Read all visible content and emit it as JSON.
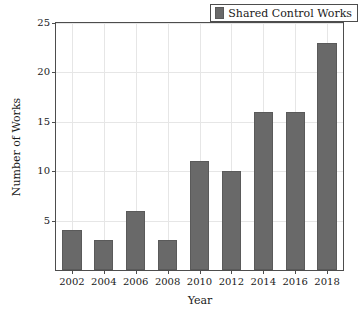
{
  "chart_data": {
    "type": "bar",
    "title": "",
    "subtitle": "",
    "xlabel": "Year",
    "ylabel": "Number of Works",
    "categories": [
      "2002",
      "2004",
      "2006",
      "2008",
      "2010",
      "2012",
      "2014",
      "2016",
      "2018"
    ],
    "values": [
      4,
      3,
      6,
      3,
      11,
      10,
      16,
      16,
      23
    ],
    "series": [
      {
        "name": "Shared Control Works",
        "values": [
          4,
          3,
          6,
          3,
          11,
          10,
          16,
          16,
          23
        ],
        "color": "#696969"
      }
    ],
    "ylim": [
      0,
      25
    ],
    "yticks": [
      5,
      10,
      15,
      20,
      25
    ],
    "ytick_labels": [
      "5",
      "10",
      "15",
      "20",
      "25"
    ],
    "xtick_labels": [
      "2002",
      "2004",
      "2006",
      "2008",
      "2010",
      "2012",
      "2014",
      "2016",
      "2018"
    ],
    "grid": true,
    "grid_axis": "both",
    "legend": {
      "entries": [
        "Shared Control Works"
      ],
      "position": "top-right",
      "marker": "filled-square-swatch"
    },
    "bar_color": "#696969",
    "bar_edge_color": "#5a5a5a",
    "axis_color": "#4d4d4d",
    "grid_color": "#e6e6e6",
    "background": "#ffffff"
  }
}
